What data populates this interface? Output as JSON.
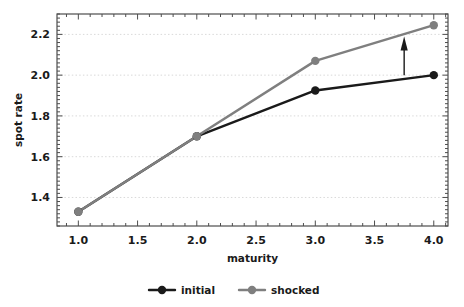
{
  "chart_data": {
    "type": "line",
    "title": "",
    "xlabel": "maturity",
    "ylabel": "spot rate",
    "x": [
      1.0,
      2.0,
      3.0,
      4.0
    ],
    "series": [
      {
        "name": "initial",
        "color": "#1a1a1a",
        "values": [
          1.33,
          1.7,
          1.925,
          2.0
        ]
      },
      {
        "name": "shocked",
        "color": "#7f7f7f",
        "values": [
          1.33,
          1.7,
          2.07,
          2.245
        ]
      }
    ],
    "xlim": [
      0.82,
      4.12
    ],
    "ylim": [
      1.26,
      2.3
    ],
    "xticks": [
      "1.0",
      "1.5",
      "2.0",
      "2.5",
      "3.0",
      "3.5",
      "4.0"
    ],
    "xtick_values": [
      1.0,
      1.5,
      2.0,
      2.5,
      3.0,
      3.5,
      4.0
    ],
    "yticks": [
      "1.4",
      "1.6",
      "1.8",
      "2.0",
      "2.2"
    ],
    "ytick_values": [
      1.4,
      1.6,
      1.8,
      2.0,
      2.2
    ],
    "grid": true,
    "grid_axis": "y",
    "legend_position": "bottom-center",
    "annotations": [
      {
        "type": "arrow",
        "label": "",
        "x": 3.75,
        "y_start": 2.0,
        "y_end": 2.175,
        "direction": "up",
        "color": "#1a1a1a"
      }
    ]
  },
  "axes": {
    "y_label": "spot rate",
    "x_label": "maturity",
    "x_tick_labels": [
      "1.0",
      "1.5",
      "2.0",
      "2.5",
      "3.0",
      "3.5",
      "4.0"
    ],
    "y_tick_labels": [
      "1.4",
      "1.6",
      "1.8",
      "2.0",
      "2.2"
    ]
  },
  "legend": {
    "items": [
      {
        "label": "initial",
        "color": "#1a1a1a"
      },
      {
        "label": "shocked",
        "color": "#7f7f7f"
      }
    ]
  },
  "colors": {
    "initial": "#1a1a1a",
    "shocked": "#7f7f7f",
    "grid": "#d9d9d9",
    "frame": "#4d4d4d",
    "background": "#ffffff"
  }
}
